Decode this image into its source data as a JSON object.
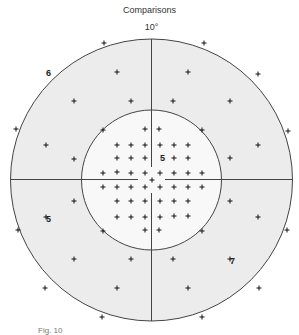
{
  "title": "Comparisons",
  "scale_label": "10°",
  "caption": "Fig. 10",
  "colors": {
    "outer_fill": "#ececec",
    "inner_fill": "#f8f8f8",
    "line": "#444444",
    "cross": "#111111"
  },
  "geometry": {
    "center": [
      151.5,
      180
    ],
    "outer_radius": 141,
    "inner_radius": 70
  },
  "quadrant_labels": [
    {
      "text": "6",
      "x": 46,
      "y": 76
    },
    {
      "text": "5",
      "x": 46,
      "y": 222
    },
    {
      "text": "5",
      "x": 160,
      "y": 161
    },
    {
      "text": "7",
      "x": 230,
      "y": 264
    }
  ],
  "test_points": [
    [
      104,
      43
    ],
    [
      204,
      43
    ],
    [
      117,
      72
    ],
    [
      188,
      72
    ],
    [
      258,
      74
    ],
    [
      74,
      101
    ],
    [
      131,
      101
    ],
    [
      173,
      101
    ],
    [
      230,
      101
    ],
    [
      16,
      129
    ],
    [
      103,
      130
    ],
    [
      145,
      129
    ],
    [
      159,
      129
    ],
    [
      202,
      130
    ],
    [
      288,
      131
    ],
    [
      46,
      145
    ],
    [
      117,
      145
    ],
    [
      131,
      145
    ],
    [
      145,
      145
    ],
    [
      160,
      145
    ],
    [
      174,
      145
    ],
    [
      188,
      145
    ],
    [
      258,
      145
    ],
    [
      74,
      159
    ],
    [
      117,
      158
    ],
    [
      131,
      158
    ],
    [
      145,
      158
    ],
    [
      174,
      158
    ],
    [
      188,
      158
    ],
    [
      230,
      158
    ],
    [
      103,
      173
    ],
    [
      117,
      172
    ],
    [
      131,
      173
    ],
    [
      145,
      173
    ],
    [
      160,
      173
    ],
    [
      174,
      173
    ],
    [
      188,
      173
    ],
    [
      202,
      173
    ],
    [
      152,
      180
    ],
    [
      103,
      187
    ],
    [
      117,
      187
    ],
    [
      131,
      187
    ],
    [
      145,
      187
    ],
    [
      160,
      187
    ],
    [
      174,
      187
    ],
    [
      188,
      187
    ],
    [
      202,
      187
    ],
    [
      74,
      201
    ],
    [
      117,
      201
    ],
    [
      131,
      201
    ],
    [
      145,
      201
    ],
    [
      160,
      201
    ],
    [
      174,
      201
    ],
    [
      188,
      201
    ],
    [
      230,
      201
    ],
    [
      46,
      217
    ],
    [
      117,
      217
    ],
    [
      131,
      217
    ],
    [
      145,
      217
    ],
    [
      160,
      217
    ],
    [
      174,
      216
    ],
    [
      188,
      216
    ],
    [
      258,
      217
    ],
    [
      18,
      230
    ],
    [
      103,
      231
    ],
    [
      145,
      230
    ],
    [
      159,
      230
    ],
    [
      202,
      231
    ],
    [
      287,
      230
    ],
    [
      74,
      259
    ],
    [
      131,
      259
    ],
    [
      173,
      259
    ],
    [
      230,
      259
    ],
    [
      45,
      288
    ],
    [
      117,
      288
    ],
    [
      188,
      288
    ],
    [
      259,
      288
    ],
    [
      102,
      317
    ],
    [
      202,
      317
    ]
  ]
}
